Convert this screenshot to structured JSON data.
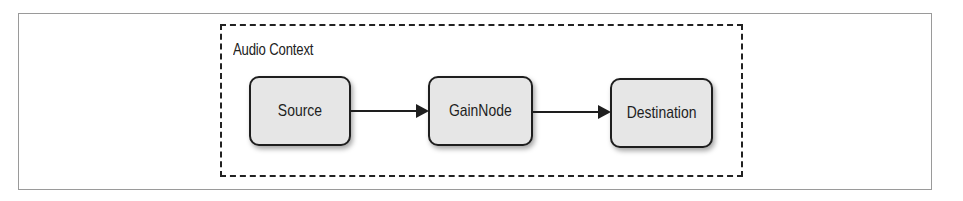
{
  "diagram": {
    "container": {
      "label": "Audio Context",
      "style": "dashed"
    },
    "nodes": [
      {
        "id": "source",
        "label": "Source"
      },
      {
        "id": "gain",
        "label": "GainNode"
      },
      {
        "id": "destination",
        "label": "Destination"
      }
    ],
    "edges": [
      {
        "from": "Source",
        "to": "GainNode"
      },
      {
        "from": "GainNode",
        "to": "Destination"
      }
    ],
    "colors": {
      "node_fill": "#e6e6e6",
      "stroke": "#1e1e1e",
      "frame": "#9a9a9a"
    }
  }
}
